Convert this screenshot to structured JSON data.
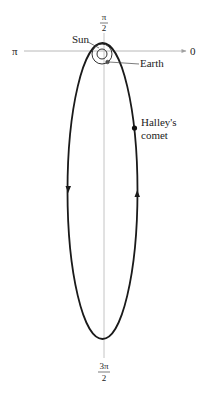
{
  "diagram": {
    "type": "polar-orbit-diagram",
    "axis_labels": {
      "angle_0": "0",
      "angle_pi": "π",
      "angle_pi_over_2": {
        "num": "π",
        "den": "2"
      },
      "angle_3pi_over_2": {
        "num": "3π",
        "den": "2"
      }
    },
    "labels": {
      "sun": "Sun",
      "earth": "Earth",
      "comet_line1": "Halley's",
      "comet_line2": "comet"
    },
    "colors": {
      "axis": "#b8b8b8",
      "orbit": "#1a1a1a",
      "text": "#222222",
      "background": "#ffffff"
    }
  }
}
